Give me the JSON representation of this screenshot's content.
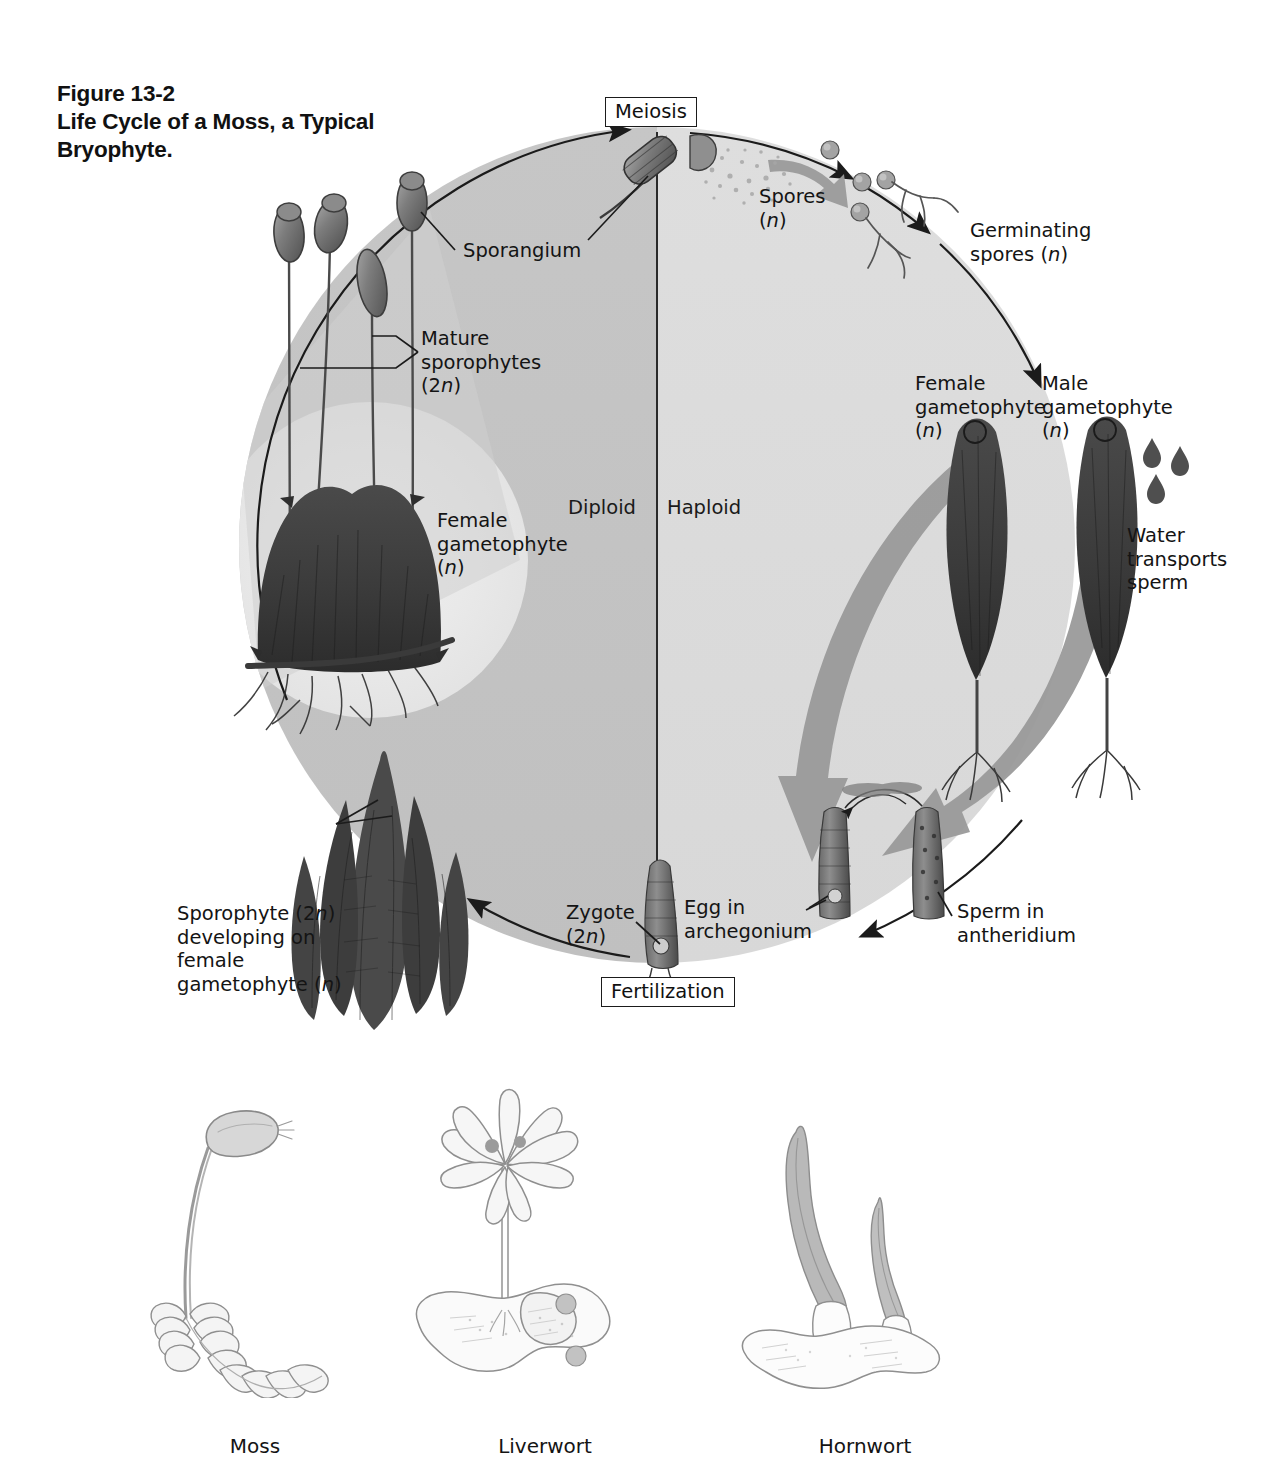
{
  "figure": {
    "number": "Figure 13-2",
    "title_line1": "Life Cycle of a Moss, a Typical",
    "title_line2": "Bryophyte."
  },
  "cycle": {
    "process_boxes": {
      "meiosis": "Meiosis",
      "fertilization": "Fertilization"
    },
    "phases": {
      "diploid": "Diploid",
      "haploid": "Haploid"
    },
    "labels": [
      {
        "key": "sporangium",
        "text": "Sporangium",
        "ploidy": ""
      },
      {
        "key": "mature_sporophytes",
        "text": "Mature sporophytes",
        "ploidy": "(2n)"
      },
      {
        "key": "spores",
        "text": "Spores",
        "ploidy": "(n)"
      },
      {
        "key": "germinating_spores",
        "text": "Germinating spores",
        "ploidy": "(n)"
      },
      {
        "key": "female_gam_right",
        "text": "Female gametophyte",
        "ploidy": "(n)"
      },
      {
        "key": "male_gam",
        "text": "Male gametophyte",
        "ploidy": "(n)"
      },
      {
        "key": "water_sperm",
        "text": "Water transports sperm",
        "ploidy": ""
      },
      {
        "key": "sperm_antheridium",
        "text": "Sperm in antheridium",
        "ploidy": ""
      },
      {
        "key": "egg_archegonium",
        "text": "Egg in archegonium",
        "ploidy": ""
      },
      {
        "key": "zygote",
        "text": "Zygote",
        "ploidy": "(2n)"
      },
      {
        "key": "sporophyte_dev",
        "text": "Sporophyte (2n) developing on female gametophyte (n)",
        "ploidy": ""
      },
      {
        "key": "female_gam_left",
        "text": "Female gametophyte",
        "ploidy": "(n)"
      }
    ],
    "label_text": {
      "sporangium": "Sporangium",
      "mature_sporophytes_l1": "Mature",
      "mature_sporophytes_l2": "sporophytes",
      "mature_sporophytes_l3": "(2n)",
      "spores_l1": "Spores",
      "spores_l2": "(n)",
      "germinating_l1": "Germinating",
      "germinating_l2": "spores (n)",
      "female_right_l1": "Female",
      "female_right_l2": "gametophyte",
      "female_right_l3": "(n)",
      "male_l1": "Male",
      "male_l2": "gametophyte",
      "male_l3": "(n)",
      "water_l1": "Water",
      "water_l2": "transports",
      "water_l3": "sperm",
      "sperm_anth_l1": "Sperm in",
      "sperm_anth_l2": "antheridium",
      "egg_arch_l1": "Egg in",
      "egg_arch_l2": "archegonium",
      "zygote_l1": "Zygote",
      "zygote_l2": "(2n)",
      "sporo_dev_l1": "Sporophyte (2n)",
      "sporo_dev_l2": "developing on",
      "sporo_dev_l3": "female",
      "sporo_dev_l4": "gametophyte (n)",
      "female_left_l1": "Female",
      "female_left_l2": "gametophyte",
      "female_left_l3": "(n)"
    }
  },
  "specimens": [
    {
      "key": "moss",
      "label": "Moss"
    },
    {
      "key": "liverwort",
      "label": "Liverwort"
    },
    {
      "key": "hornwort",
      "label": "Hornwort"
    }
  ],
  "colors": {
    "diploid_half": "#c4c4c4",
    "haploid_half": "#dcdcdc",
    "highlight_glow": "#ebebeb",
    "outline": "#1b1b1b",
    "thick_arrow": "#9a9a9a",
    "text": "#141414",
    "background": "#ffffff"
  }
}
